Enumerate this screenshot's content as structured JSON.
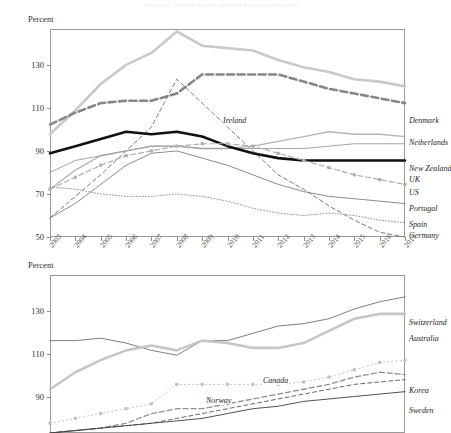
{
  "figure": {
    "title": "Figure 5. Trends in the relative house price index",
    "unit_label": "Percent"
  },
  "panels": [
    {
      "name": "panel-1",
      "unit_label": "Percent",
      "y_ticks": [
        "130",
        "110",
        "90",
        "70",
        "50"
      ],
      "x_ticks": [
        "2003",
        "2004",
        "2005",
        "2006",
        "2007",
        "2008",
        "2009",
        "2010",
        "2011",
        "2012",
        "2013",
        "2014",
        "2015",
        "2016",
        "2017"
      ],
      "right_labels": [
        "Denmark",
        "Netherlands",
        "New Zealand",
        "UK",
        "US",
        "Portugal",
        "Spain",
        "Germany"
      ],
      "inline_labels": [
        "Ireland"
      ]
    },
    {
      "name": "panel-2",
      "unit_label": "Percent",
      "y_ticks": [
        "130",
        "110",
        "90"
      ],
      "x_ticks": [],
      "right_labels": [
        "Switzerland",
        "Australia",
        "Korea",
        "Sweden"
      ],
      "inline_labels": [
        "Canada",
        "Norway"
      ]
    }
  ],
  "chart_data": [
    {
      "type": "line",
      "title": "Figure 5. Trends in the relative house price index",
      "xlabel": "",
      "ylabel": "Percent",
      "ylim": [
        50,
        137
      ],
      "xlim": [
        2003,
        2017
      ],
      "grid": false,
      "legend": "right-of-plot inline labels",
      "x": [
        2003,
        2004,
        2005,
        2006,
        2007,
        2008,
        2009,
        2010,
        2011,
        2012,
        2013,
        2014,
        2015,
        2016,
        2017
      ],
      "series": [
        {
          "name": "Denmark",
          "color": "#c9c9c9",
          "style": "solid-thick",
          "values": [
            93,
            103,
            114,
            122,
            127,
            136,
            130,
            129,
            128,
            124,
            121,
            119,
            116,
            115,
            113
          ]
        },
        {
          "name": "Netherlands",
          "color": "#868686",
          "style": "dashed-thick",
          "values": [
            97,
            102,
            106,
            107,
            107,
            110,
            118,
            118,
            118,
            118,
            115,
            112,
            110,
            108,
            106
          ]
        },
        {
          "name": "Ireland",
          "color": "#6a6a6a",
          "style": "dashed-thin",
          "values": [
            58,
            67,
            76,
            86,
            96,
            116,
            106,
            96,
            86,
            76,
            70,
            63,
            57,
            52,
            50
          ]
        },
        {
          "name": "New Zealand",
          "color": "#b4b4b4",
          "style": "solid-medium",
          "values": [
            70,
            78,
            84,
            86,
            88,
            88,
            87,
            87,
            88,
            90,
            92,
            94,
            93,
            93,
            92
          ]
        },
        {
          "name": "UK",
          "color": "#9a9a9a",
          "style": "solid-thin",
          "values": [
            77,
            82,
            84,
            86,
            88,
            88,
            87,
            87,
            87,
            87,
            87,
            88,
            89,
            89,
            89
          ]
        },
        {
          "name": "US",
          "color": "#111111",
          "style": "solid-thick",
          "values": [
            85,
            88,
            91,
            94,
            93,
            94,
            92,
            88,
            85,
            83,
            82,
            82,
            82,
            82,
            82
          ]
        },
        {
          "name": "Portugal",
          "color": "#b0b0b0",
          "style": "dashed-marker",
          "values": [
            70,
            75,
            80,
            84,
            86,
            88,
            89,
            89,
            88,
            85,
            82,
            79,
            76,
            74,
            72
          ]
        },
        {
          "name": "Spain",
          "color": "#7d7d7d",
          "style": "solid-thin",
          "values": [
            58,
            64,
            72,
            80,
            85,
            86,
            83,
            80,
            76,
            72,
            69,
            67,
            66,
            65,
            64
          ]
        },
        {
          "name": "Germany",
          "color": "#8a8a8a",
          "style": "dotted",
          "values": [
            71,
            70,
            68,
            67,
            67,
            68,
            67,
            65,
            62,
            60,
            59,
            60,
            59,
            57,
            56
          ]
        }
      ]
    },
    {
      "type": "line",
      "title": "",
      "xlabel": "",
      "ylabel": "Percent",
      "ylim": [
        72,
        137
      ],
      "xlim": [
        2003,
        2017
      ],
      "grid": false,
      "legend": "right-of-plot inline labels",
      "x": [
        2003,
        2004,
        2005,
        2006,
        2007,
        2008,
        2009,
        2010,
        2011,
        2012,
        2013,
        2014,
        2015,
        2016,
        2017
      ],
      "series": [
        {
          "name": "Switzerland",
          "color": "#6f6f6f",
          "style": "solid-thin",
          "values": [
            110,
            110,
            111,
            109,
            106,
            104,
            110,
            110,
            113,
            116,
            117,
            119,
            123,
            126,
            128
          ]
        },
        {
          "name": "Australia",
          "color": "#c6c6c6",
          "style": "solid-thick",
          "values": [
            90,
            97,
            102,
            106,
            108,
            106,
            110,
            109,
            107,
            107,
            109,
            114,
            119,
            121,
            121
          ]
        },
        {
          "name": "Canada",
          "color": "#c2c2c2",
          "style": "dotted-marker",
          "values": [
            76,
            78,
            80,
            82,
            84,
            92,
            92,
            92,
            92,
            92,
            93,
            95,
            98,
            101,
            102
          ]
        },
        {
          "name": "Norway",
          "color": "#8f8f8f",
          "style": "dashed-medium",
          "values": [
            72,
            73,
            74,
            76,
            80,
            82,
            82,
            84,
            86,
            88,
            90,
            92,
            95,
            97,
            96
          ]
        },
        {
          "name": "Korea",
          "color": "#555555",
          "style": "dashed-thin",
          "values": [
            72,
            73,
            74,
            75,
            76,
            78,
            80,
            82,
            84,
            86,
            88,
            90,
            92,
            93,
            94
          ]
        },
        {
          "name": "Sweden",
          "color": "#3d3d3d",
          "style": "solid-thin",
          "values": [
            72,
            73,
            74,
            75,
            76,
            77,
            78,
            80,
            82,
            83,
            85,
            86,
            87,
            88,
            89
          ]
        }
      ]
    }
  ]
}
